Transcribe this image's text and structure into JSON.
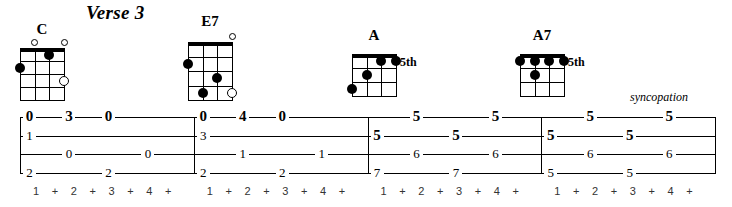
{
  "sheet": {
    "section_title": "Verse 3",
    "direction": "syncopation"
  },
  "chords": [
    {
      "name": "C",
      "fret_label": "",
      "strings": 4,
      "frets": 4,
      "open_markers": [
        {
          "string": 2
        },
        {
          "string": 4
        }
      ],
      "dots": [
        {
          "string": 3,
          "fret": 1
        },
        {
          "string": 1,
          "fret": 2
        }
      ],
      "open_in_grid": [
        {
          "string": 4,
          "fret": 3
        }
      ]
    },
    {
      "name": "E7",
      "fret_label": "",
      "strings": 4,
      "frets": 4,
      "open_markers": [
        {
          "string": 4
        }
      ],
      "dots": [
        {
          "string": 1,
          "fret": 2
        },
        {
          "string": 3,
          "fret": 3
        },
        {
          "string": 2,
          "fret": 4
        }
      ],
      "open_in_grid": [
        {
          "string": 4,
          "fret": 4
        }
      ]
    },
    {
      "name": "A",
      "fret_label": "5th",
      "strings": 4,
      "frets": 3,
      "open_markers": [],
      "dots": [
        {
          "string": 3,
          "fret": 1
        },
        {
          "string": 4,
          "fret": 1
        },
        {
          "string": 2,
          "fret": 2
        },
        {
          "string": 1,
          "fret": 3
        }
      ],
      "open_in_grid": []
    },
    {
      "name": "A7",
      "fret_label": "5th",
      "strings": 4,
      "frets": 3,
      "open_markers": [],
      "dots": [
        {
          "string": 1,
          "fret": 1
        },
        {
          "string": 2,
          "fret": 1
        },
        {
          "string": 3,
          "fret": 1
        },
        {
          "string": 4,
          "fret": 1
        },
        {
          "string": 2,
          "fret": 2
        }
      ],
      "open_in_grid": []
    }
  ],
  "tab": {
    "string_count": 4,
    "measures": [
      {
        "index": 1,
        "count_row": [
          "1",
          "+",
          "2",
          "+",
          "3",
          "+",
          "4",
          "+"
        ],
        "notes": [
          {
            "beat": 1,
            "string": 1,
            "fret": "0",
            "bold": true
          },
          {
            "beat": 1,
            "string": 2,
            "fret": "1",
            "bold": false
          },
          {
            "beat": 1,
            "string": 4,
            "fret": "2",
            "bold": false
          },
          {
            "beat": 2,
            "string": 1,
            "fret": "3",
            "bold": true
          },
          {
            "beat": 2,
            "string": 3,
            "fret": "0",
            "bold": false
          },
          {
            "beat": 3,
            "string": 1,
            "fret": "0",
            "bold": true
          },
          {
            "beat": 3,
            "string": 4,
            "fret": "2",
            "bold": false
          },
          {
            "beat": 4,
            "string": 3,
            "fret": "0",
            "bold": false
          }
        ]
      },
      {
        "index": 2,
        "count_row": [
          "1",
          "+",
          "2",
          "+",
          "3",
          "+",
          "4",
          "+"
        ],
        "notes": [
          {
            "beat": 1,
            "string": 1,
            "fret": "0",
            "bold": true
          },
          {
            "beat": 1,
            "string": 2,
            "fret": "3",
            "bold": false
          },
          {
            "beat": 1,
            "string": 4,
            "fret": "2",
            "bold": false
          },
          {
            "beat": 2,
            "string": 1,
            "fret": "4",
            "bold": true
          },
          {
            "beat": 2,
            "string": 3,
            "fret": "1",
            "bold": false
          },
          {
            "beat": 3,
            "string": 1,
            "fret": "0",
            "bold": true
          },
          {
            "beat": 3,
            "string": 4,
            "fret": "2",
            "bold": false
          },
          {
            "beat": 4,
            "string": 3,
            "fret": "1",
            "bold": false
          }
        ]
      },
      {
        "index": 3,
        "count_row": [
          "1",
          "+",
          "2",
          "+",
          "3",
          "+",
          "4",
          "+"
        ],
        "notes": [
          {
            "beat": 1,
            "string": 2,
            "fret": "5",
            "bold": true
          },
          {
            "beat": 1,
            "string": 4,
            "fret": "7",
            "bold": false
          },
          {
            "beat": 2,
            "string": 1,
            "fret": "5",
            "bold": true
          },
          {
            "beat": 2,
            "string": 3,
            "fret": "6",
            "bold": false
          },
          {
            "beat": 3,
            "string": 2,
            "fret": "5",
            "bold": true
          },
          {
            "beat": 3,
            "string": 4,
            "fret": "7",
            "bold": false
          },
          {
            "beat": 4,
            "string": 1,
            "fret": "5",
            "bold": true
          },
          {
            "beat": 4,
            "string": 3,
            "fret": "6",
            "bold": false
          }
        ]
      },
      {
        "index": 4,
        "count_row": [
          "1",
          "+",
          "2",
          "+",
          "3",
          "+",
          "4",
          "+"
        ],
        "notes": [
          {
            "beat": 1,
            "string": 2,
            "fret": "5",
            "bold": true
          },
          {
            "beat": 1,
            "string": 4,
            "fret": "5",
            "bold": false
          },
          {
            "beat": 2,
            "string": 1,
            "fret": "5",
            "bold": true
          },
          {
            "beat": 2,
            "string": 3,
            "fret": "6",
            "bold": false
          },
          {
            "beat": 3,
            "string": 2,
            "fret": "5",
            "bold": true
          },
          {
            "beat": 3,
            "string": 4,
            "fret": "5",
            "bold": false
          },
          {
            "beat": 4,
            "string": 1,
            "fret": "5",
            "bold": true
          },
          {
            "beat": 4,
            "string": 3,
            "fret": "6",
            "bold": false
          }
        ]
      }
    ]
  },
  "colors": {
    "ink": "#000000",
    "paper": "#ffffff"
  }
}
